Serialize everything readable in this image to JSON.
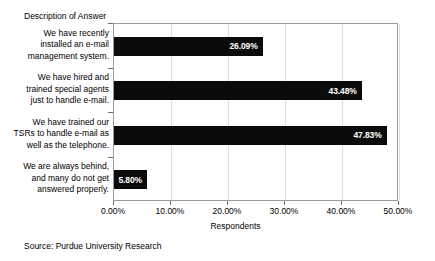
{
  "chart_data": {
    "type": "bar",
    "orientation": "horizontal",
    "title": "",
    "ylabel": "Description of Answer",
    "xlabel": "Respondents",
    "xlim": [
      0,
      50
    ],
    "grid": true,
    "legend": false,
    "categories": [
      "We have recently installed an e-mail management system.",
      "We have hired and trained special agents just to handle e-mail.",
      "We have trained our TSRs to handle e-mail as well as the telephone.",
      "We are always behind, and many do not get answered properly."
    ],
    "values": [
      26.09,
      43.48,
      47.83,
      5.8
    ],
    "value_labels": [
      "26.09%",
      "43.48%",
      "47.83%",
      "5.80%"
    ],
    "xticks": [
      0,
      10,
      20,
      30,
      40,
      50
    ],
    "xtick_labels": [
      "0.00%",
      "10.00%",
      "20.00%",
      "30.00%",
      "40.00%",
      "50.00%"
    ],
    "bar_color": "#0b0b0b",
    "value_label_color": "#ffffff",
    "plot_border_color": "#9a9a9a",
    "gridline_color": "#dedede"
  },
  "caption": {
    "source": "Source: Purdue University Research"
  }
}
